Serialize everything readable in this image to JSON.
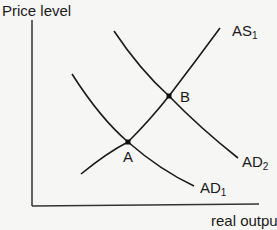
{
  "diagram": {
    "type": "AD-AS shift diagram",
    "axes": {
      "y_label": "Price level",
      "x_label": "real output"
    },
    "curves": [
      {
        "id": "AS1",
        "label": "AS",
        "subscript": "1",
        "kind": "aggregate supply"
      },
      {
        "id": "AD1",
        "label": "AD",
        "subscript": "1",
        "kind": "aggregate demand"
      },
      {
        "id": "AD2",
        "label": "AD",
        "subscript": "2",
        "kind": "aggregate demand"
      }
    ],
    "points": [
      {
        "id": "A",
        "label": "A",
        "intersection": [
          "AS1",
          "AD1"
        ]
      },
      {
        "id": "B",
        "label": "B",
        "intersection": [
          "AS1",
          "AD2"
        ]
      }
    ],
    "colors": {
      "line": "#1a1a1a",
      "background": "#f6f6f4"
    }
  }
}
